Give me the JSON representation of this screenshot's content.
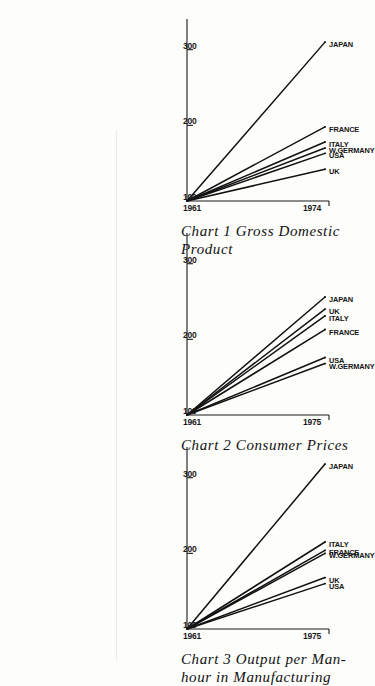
{
  "figure": {
    "orientation": "rotated-90-clockwise",
    "axis_color": "#1a1a1a",
    "line_color": "#111111",
    "background": "#fdfdfb"
  },
  "charts": [
    {
      "id": "chart-1",
      "number": "Chart 1",
      "title_words": [
        "Chart",
        "1",
        "Gross",
        "Domestic"
      ],
      "title_line1": "Chart 1  Gross  Domestic",
      "title_line2": "Product",
      "x_start_label": "1961",
      "x_end_label": "1974",
      "y_base_label": "100",
      "y_ticks": [
        "100",
        "200",
        "300"
      ],
      "series": [
        {
          "name": "JAPAN",
          "end_value": 310
        },
        {
          "name": "FRANCE",
          "end_value": 198
        },
        {
          "name": "ITALY",
          "end_value": 178
        },
        {
          "name": "W.GERMANY",
          "end_value": 170
        },
        {
          "name": "USA",
          "end_value": 163
        },
        {
          "name": "UK",
          "end_value": 142
        }
      ]
    },
    {
      "id": "chart-2",
      "number": "Chart 2",
      "title_words": [
        "Chart",
        "2",
        "Consumer",
        "Prices"
      ],
      "title_line1": "Chart 2  Consumer  Prices",
      "title_line2": "",
      "x_start_label": "1961",
      "x_end_label": "1975",
      "y_base_label": "100",
      "y_ticks": [
        "100",
        "200",
        "300"
      ],
      "series": [
        {
          "name": "JAPAN",
          "end_value": 256
        },
        {
          "name": "UK",
          "end_value": 240
        },
        {
          "name": "ITALY",
          "end_value": 231
        },
        {
          "name": "FRANCE",
          "end_value": 213
        },
        {
          "name": "USA",
          "end_value": 176
        },
        {
          "name": "W.GERMANY",
          "end_value": 168
        }
      ]
    },
    {
      "id": "chart-3",
      "number": "Chart 3",
      "title_words": [
        "Chart",
        "3",
        "Output",
        "per",
        "Man-"
      ],
      "title_line1": "Chart 3  Output  per  Man-",
      "title_line2": "hour in Manufacturing",
      "x_start_label": "1961",
      "x_end_label": "1975",
      "y_base_label": "100",
      "y_ticks": [
        "100",
        "200",
        "300"
      ],
      "series": [
        {
          "name": "JAPAN",
          "end_value": 318
        },
        {
          "name": "ITALY",
          "end_value": 215
        },
        {
          "name": "FRANCE",
          "end_value": 204
        },
        {
          "name": "W.GERMANY",
          "end_value": 200
        },
        {
          "name": "UK",
          "end_value": 168
        },
        {
          "name": "USA",
          "end_value": 160
        }
      ]
    }
  ],
  "chart_data": {
    "type": "line",
    "xlabel": "",
    "ylabel": "Index (1961 = 100)",
    "ylim": [
      100,
      330
    ],
    "grid": false,
    "legend": "inline-end-labels",
    "panels": [
      {
        "title": "Chart 1  Gross Domestic Product",
        "x": [
          1961,
          1974
        ],
        "xticklabels": [
          "1961",
          "1974"
        ],
        "yticks": [
          100,
          200,
          300
        ],
        "series": [
          {
            "name": "JAPAN",
            "values": [
              100,
              310
            ]
          },
          {
            "name": "FRANCE",
            "values": [
              100,
              198
            ]
          },
          {
            "name": "ITALY",
            "values": [
              100,
              178
            ]
          },
          {
            "name": "W.GERMANY",
            "values": [
              100,
              170
            ]
          },
          {
            "name": "USA",
            "values": [
              100,
              163
            ]
          },
          {
            "name": "UK",
            "values": [
              100,
              142
            ]
          }
        ]
      },
      {
        "title": "Chart 2  Consumer Prices",
        "x": [
          1961,
          1975
        ],
        "xticklabels": [
          "1961",
          "1975"
        ],
        "yticks": [
          100,
          200,
          300
        ],
        "series": [
          {
            "name": "JAPAN",
            "values": [
              100,
              256
            ]
          },
          {
            "name": "UK",
            "values": [
              100,
              240
            ]
          },
          {
            "name": "ITALY",
            "values": [
              100,
              231
            ]
          },
          {
            "name": "FRANCE",
            "values": [
              100,
              213
            ]
          },
          {
            "name": "USA",
            "values": [
              100,
              176
            ]
          },
          {
            "name": "W.GERMANY",
            "values": [
              100,
              168
            ]
          }
        ]
      },
      {
        "title": "Chart 3  Output per Man-hour in Manufacturing",
        "x": [
          1961,
          1975
        ],
        "xticklabels": [
          "1961",
          "1975"
        ],
        "yticks": [
          100,
          200,
          300
        ],
        "series": [
          {
            "name": "JAPAN",
            "values": [
              100,
              318
            ]
          },
          {
            "name": "ITALY",
            "values": [
              100,
              215
            ]
          },
          {
            "name": "FRANCE",
            "values": [
              100,
              204
            ]
          },
          {
            "name": "W.GERMANY",
            "values": [
              100,
              200
            ]
          },
          {
            "name": "UK",
            "values": [
              100,
              168
            ]
          },
          {
            "name": "USA",
            "values": [
              100,
              160
            ]
          }
        ]
      }
    ]
  }
}
